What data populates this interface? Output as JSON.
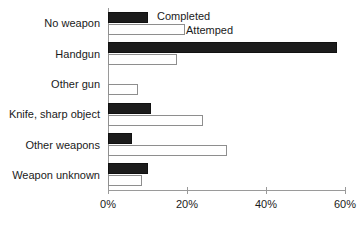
{
  "chart_data": {
    "type": "bar",
    "orientation": "horizontal",
    "title": "",
    "xlabel": "",
    "ylabel": "",
    "xlim": [
      0,
      60
    ],
    "grid": false,
    "legend_position": "inline-top-left",
    "categories": [
      "No weapon",
      "Handgun",
      "Other gun",
      "Knife, sharp object",
      "Other weapons",
      "Weapon unknown"
    ],
    "tick_labels": [
      "0%",
      "20%",
      "40%",
      "60%"
    ],
    "tick_values": [
      0,
      20,
      40,
      60
    ],
    "series": [
      {
        "name": "Completed",
        "color": "#1c1c1c",
        "values": [
          10,
          58,
          0,
          11,
          6,
          10
        ]
      },
      {
        "name": "Attemped",
        "color": "#ffffff",
        "values": [
          19.5,
          17.5,
          7.5,
          24,
          30,
          8.5
        ]
      }
    ]
  },
  "axis": {
    "tick_suffix": "%"
  }
}
